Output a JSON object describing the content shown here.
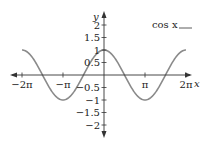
{
  "chart_data": {
    "type": "line",
    "title": "",
    "xlabel": "x",
    "ylabel": "y",
    "legend": {
      "label": "cos x",
      "position": "top-right"
    },
    "series": [
      {
        "name": "cos x",
        "function": "cos(x)",
        "x_range": [
          -6.283,
          6.283
        ],
        "color": "#8a8a8a"
      }
    ],
    "xlim": [
      -6.8,
      6.9
    ],
    "ylim": [
      -2.4,
      2.5
    ],
    "x_ticks": [
      {
        "value": -6.283,
        "label": "−2π"
      },
      {
        "value": -3.1416,
        "label": "−π"
      },
      {
        "value": 3.1416,
        "label": "π"
      },
      {
        "value": 6.283,
        "label": "2π"
      }
    ],
    "y_ticks": [
      {
        "value": 2,
        "label": "2"
      },
      {
        "value": 1.5,
        "label": "1.5"
      },
      {
        "value": 1,
        "label": "1"
      },
      {
        "value": 0.5,
        "label": "0.5"
      },
      {
        "value": -0.5,
        "label": "−0.5"
      },
      {
        "value": -1,
        "label": "−1"
      },
      {
        "value": -1.5,
        "label": "−1.5"
      },
      {
        "value": -2,
        "label": "−2"
      }
    ],
    "grid": false,
    "colors": {
      "axis": "#333333",
      "curve": "#8a8a8a"
    }
  }
}
